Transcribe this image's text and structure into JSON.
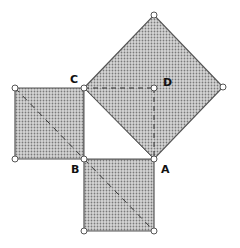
{
  "diagram": {
    "fill_color": "#bdbdbd",
    "stroke_color": "#555555",
    "labels": {
      "A": "A",
      "B": "B",
      "C": "C",
      "D": "D"
    },
    "points": {
      "A": [
        154,
        159
      ],
      "B": [
        84,
        159
      ],
      "C": [
        84,
        88
      ],
      "D": [
        154,
        88
      ]
    },
    "shapes": [
      {
        "name": "square-on-hypotenuse",
        "vertices": [
          [
            84,
            88
          ],
          [
            154,
            15
          ],
          [
            223,
            87
          ],
          [
            154,
            159
          ]
        ]
      },
      {
        "name": "square-left",
        "vertices": [
          [
            15,
            88
          ],
          [
            84,
            88
          ],
          [
            84,
            159
          ],
          [
            15,
            159
          ]
        ]
      },
      {
        "name": "square-bottom",
        "vertices": [
          [
            84,
            159
          ],
          [
            154,
            159
          ],
          [
            154,
            231
          ],
          [
            84,
            231
          ]
        ]
      }
    ]
  }
}
